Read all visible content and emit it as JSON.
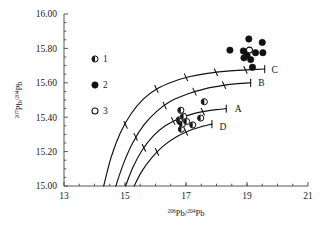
{
  "chart_data": {
    "type": "scatter",
    "title": "",
    "xlabel": "206Pb/204Pb",
    "ylabel": "207Pb/204Pb",
    "xlabel_parts": {
      "sup1": "206",
      "base1": "Pb/",
      "sup2": "204",
      "base2": "Pb"
    },
    "ylabel_parts": {
      "sup1": "207",
      "base1": "Pb/",
      "sup2": "204",
      "base2": "Pb"
    },
    "xlim": [
      13,
      21
    ],
    "ylim": [
      15.0,
      16.0
    ],
    "xticks": [
      13,
      15,
      17,
      19,
      21
    ],
    "xtick_labels": [
      "13",
      "15",
      "17",
      "19",
      "21"
    ],
    "yticks": [
      15.0,
      15.2,
      15.4,
      15.6,
      15.8,
      16.0
    ],
    "ytick_labels": [
      "15.00",
      "15.20",
      "15.40",
      "15.60",
      "15.80",
      "16.00"
    ],
    "xminor_step": 0.5,
    "grid": false,
    "legend_position": "upper-left-inside",
    "series": [
      {
        "name": "1",
        "marker": "half-filled-circle",
        "color": "#111111",
        "points": [
          [
            16.78,
            15.385
          ],
          [
            16.8,
            15.375
          ],
          [
            16.83,
            15.44
          ],
          [
            16.85,
            15.33
          ],
          [
            16.88,
            15.36
          ],
          [
            16.92,
            15.405
          ],
          [
            17.02,
            15.375
          ],
          [
            17.22,
            15.355
          ],
          [
            17.48,
            15.395
          ],
          [
            17.6,
            15.49
          ]
        ]
      },
      {
        "name": "2",
        "marker": "filled-circle",
        "color": "#111111",
        "points": [
          [
            18.44,
            15.79
          ],
          [
            18.88,
            15.785
          ],
          [
            18.9,
            15.745
          ],
          [
            19.0,
            15.76
          ],
          [
            19.06,
            15.855
          ],
          [
            19.12,
            15.735
          ],
          [
            19.18,
            15.69
          ],
          [
            19.28,
            15.775
          ],
          [
            19.5,
            15.835
          ],
          [
            19.52,
            15.775
          ]
        ]
      },
      {
        "name": "3",
        "marker": "open-circle",
        "color": "#111111",
        "points": [
          [
            19.08,
            15.79
          ]
        ]
      }
    ],
    "curves": [
      {
        "label": "C",
        "label_position": [
          19.75,
          15.675
        ],
        "points": [
          [
            14.3,
            15.0
          ],
          [
            14.55,
            15.17
          ],
          [
            14.85,
            15.31
          ],
          [
            15.2,
            15.42
          ],
          [
            15.6,
            15.505
          ],
          [
            16.05,
            15.565
          ],
          [
            16.55,
            15.605
          ],
          [
            17.1,
            15.635
          ],
          [
            17.7,
            15.655
          ],
          [
            18.35,
            15.668
          ],
          [
            19.0,
            15.675
          ],
          [
            19.58,
            15.68
          ]
        ],
        "ticks": [
          [
            15.02,
            15.355
          ],
          [
            16.03,
            15.565
          ],
          [
            17.0,
            15.632
          ],
          [
            17.98,
            15.662
          ],
          [
            18.95,
            15.675
          ]
        ]
      },
      {
        "label": "B",
        "label_position": [
          19.32,
          15.6
        ],
        "points": [
          [
            14.7,
            15.0
          ],
          [
            14.95,
            15.13
          ],
          [
            15.25,
            15.25
          ],
          [
            15.62,
            15.355
          ],
          [
            16.05,
            15.435
          ],
          [
            16.52,
            15.495
          ],
          [
            17.05,
            15.535
          ],
          [
            17.62,
            15.565
          ],
          [
            18.22,
            15.585
          ],
          [
            18.7,
            15.595
          ],
          [
            19.12,
            15.6
          ]
        ],
        "ticks": [
          [
            15.35,
            15.285
          ],
          [
            16.3,
            15.468
          ],
          [
            17.28,
            15.548
          ],
          [
            18.25,
            15.586
          ]
        ]
      },
      {
        "label": "A",
        "label_position": [
          18.55,
          15.45
        ],
        "points": [
          [
            15.02,
            15.0
          ],
          [
            15.25,
            15.105
          ],
          [
            15.55,
            15.205
          ],
          [
            15.92,
            15.29
          ],
          [
            16.32,
            15.35
          ],
          [
            16.75,
            15.39
          ],
          [
            17.2,
            15.418
          ],
          [
            17.65,
            15.435
          ],
          [
            18.05,
            15.445
          ],
          [
            18.32,
            15.45
          ]
        ],
        "ticks": [
          [
            15.62,
            15.222
          ],
          [
            16.58,
            15.378
          ],
          [
            17.55,
            15.432
          ]
        ]
      },
      {
        "label": "D",
        "label_position": [
          18.05,
          15.345
        ],
        "points": [
          [
            15.3,
            15.0
          ],
          [
            15.55,
            15.085
          ],
          [
            15.88,
            15.165
          ],
          [
            16.25,
            15.232
          ],
          [
            16.65,
            15.282
          ],
          [
            17.08,
            15.32
          ],
          [
            17.5,
            15.345
          ],
          [
            17.85,
            15.36
          ]
        ],
        "ticks": [
          [
            16.05,
            15.198
          ],
          [
            17.0,
            15.315
          ]
        ]
      }
    ]
  },
  "legend": {
    "entries": [
      {
        "label": "1",
        "marker": "half-filled-circle"
      },
      {
        "label": "2",
        "marker": "filled-circle"
      },
      {
        "label": "3",
        "marker": "open-circle"
      }
    ]
  }
}
